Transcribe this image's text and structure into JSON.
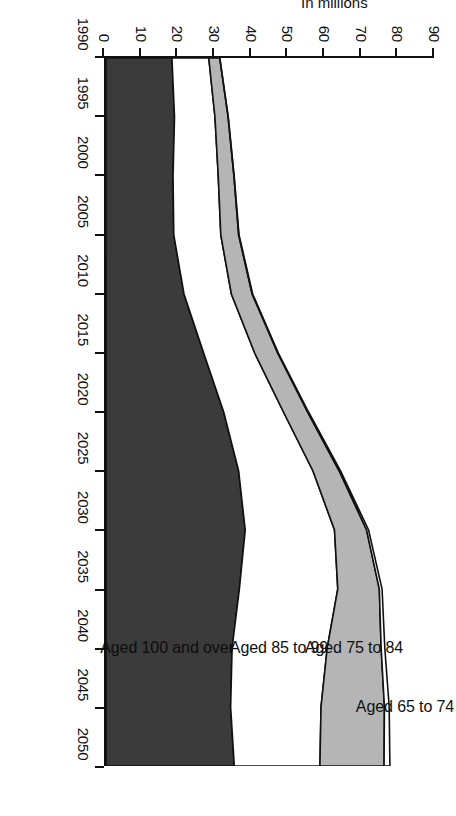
{
  "chart_data": {
    "type": "area",
    "title": "",
    "subtitle": "",
    "xlabel": "Year",
    "ylabel": "In millions",
    "grid": false,
    "legend_position": "in-plot",
    "orientation": "rotated-90-clockwise",
    "x": [
      1990,
      1995,
      2000,
      2005,
      2010,
      2015,
      2020,
      2025,
      2030,
      2035,
      2040,
      2045,
      2050
    ],
    "xlim": [
      1990,
      2050
    ],
    "ylim": [
      0,
      90
    ],
    "xticks": [
      1990,
      1995,
      2000,
      2005,
      2010,
      2015,
      2020,
      2025,
      2030,
      2035,
      2040,
      2045,
      2050
    ],
    "xtick_labels": [
      "1990",
      "1995",
      "2000",
      "2005",
      "2010",
      "2015",
      "2020",
      "2025",
      "2030",
      "2035",
      "2040",
      "2045",
      "2050"
    ],
    "yticks": [
      0,
      10,
      20,
      30,
      40,
      50,
      60,
      70,
      80,
      90
    ],
    "ytick_labels": [
      "0",
      "10",
      "20",
      "30",
      "40",
      "50",
      "60",
      "70",
      "80",
      "90"
    ],
    "stacked": true,
    "series": [
      {
        "name": "Aged 65 to 74",
        "color": "#3b3b3b",
        "values": [
          18.1,
          18.8,
          18.4,
          18.6,
          21.4,
          26.8,
          32.3,
          36.4,
          38.2,
          36.6,
          34.6,
          34.2,
          35.2
        ]
      },
      {
        "name": "Aged 75 to 84",
        "color": "#ffffff",
        "values": [
          10.1,
          11.1,
          12.4,
          12.9,
          13.0,
          14.0,
          16.4,
          20.4,
          24.5,
          27.0,
          26.1,
          24.8,
          23.5
        ]
      },
      {
        "name": "Aged 85 to 99",
        "color": "#b5b5b5",
        "values": [
          3.0,
          3.6,
          4.3,
          4.9,
          5.7,
          6.3,
          6.6,
          7.2,
          8.8,
          11.4,
          14.8,
          17.4,
          17.6
        ]
      },
      {
        "name": "Aged 100 and over",
        "color": "#ffffff",
        "values": [
          0.04,
          0.06,
          0.08,
          0.11,
          0.14,
          0.19,
          0.27,
          0.39,
          0.55,
          0.75,
          1.0,
          1.3,
          1.6
        ]
      }
    ],
    "cumulative_boundaries": {
      "top_of_65_74": [
        18.1,
        18.8,
        18.4,
        18.6,
        21.4,
        26.8,
        32.3,
        36.4,
        38.2,
        36.6,
        34.6,
        34.2,
        35.2
      ],
      "top_of_75_84": [
        28.2,
        29.9,
        30.8,
        31.5,
        34.4,
        40.8,
        48.7,
        56.8,
        62.7,
        63.6,
        60.7,
        59.0,
        58.7
      ],
      "top_of_85_99": [
        31.2,
        33.5,
        35.1,
        36.4,
        40.1,
        47.1,
        55.3,
        64.0,
        71.5,
        75.0,
        75.5,
        76.4,
        76.3
      ],
      "top_of_100_over": [
        31.2,
        33.6,
        35.2,
        36.5,
        40.2,
        47.3,
        55.6,
        64.4,
        72.1,
        75.8,
        76.5,
        77.7,
        77.9
      ]
    },
    "series_labels_in_plot": [
      {
        "text": "Aged 100 and over",
        "near_year": 2040
      },
      {
        "text": "Aged 85 to 99",
        "near_year": 2040
      },
      {
        "text": "Aged 75 to 84",
        "near_year": 2040
      },
      {
        "text": "Aged 65 to 74",
        "near_year": 2043
      }
    ]
  },
  "colors": {
    "band_65_74": "#3b3b3b",
    "band_75_84": "#ffffff",
    "band_85_99": "#b5b5b5",
    "band_100_over": "#ffffff",
    "axis": "#111111",
    "background": "#ffffff"
  }
}
